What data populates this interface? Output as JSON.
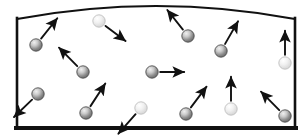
{
  "figure": {
    "title": "",
    "caption": "",
    "background_color": "#ffffff"
  },
  "container": {
    "name": "gas-container",
    "stroke_color": "#111111",
    "fill_color": "#ffffff",
    "wall_thickness_side": 2.6,
    "wall_thickness_bottom": 4.0,
    "wall_thickness_top": 2.2,
    "left_x": 17,
    "right_x": 295,
    "bottom_y": 128,
    "top_left_y": 19,
    "top_right_y": 19,
    "top_apex_x": 156,
    "top_apex_y": 4,
    "inner_shadow_color": "#f2f2f2"
  },
  "particles": {
    "dark_fill_center": "#e8e8e8",
    "dark_fill_edge": "#6d6d6d",
    "dark_stroke": "#4a4a4a",
    "light_fill_center": "#ffffff",
    "light_fill_edge": "#d2d2d2",
    "light_stroke": "#bdbdbd",
    "radius": 6.2,
    "items": [
      {
        "id": "particle-1",
        "shade": "dark",
        "cx": 36,
        "cy": 45,
        "vx": 0.62,
        "vy": -0.78,
        "speed": 26
      },
      {
        "id": "particle-2",
        "shade": "light",
        "cx": 99,
        "cy": 21,
        "vx": 0.8,
        "vy": 0.6,
        "speed": 25
      },
      {
        "id": "particle-3",
        "shade": "dark",
        "cx": 83,
        "cy": 72,
        "vx": -0.7,
        "vy": -0.71,
        "speed": 26
      },
      {
        "id": "particle-4",
        "shade": "dark",
        "cx": 188,
        "cy": 36,
        "vx": -0.62,
        "vy": -0.78,
        "speed": 25
      },
      {
        "id": "particle-5",
        "shade": "dark",
        "cx": 221,
        "cy": 51,
        "vx": 0.5,
        "vy": -0.87,
        "speed": 26
      },
      {
        "id": "particle-6",
        "shade": "dark",
        "cx": 152,
        "cy": 72,
        "vx": 1.0,
        "vy": 0.0,
        "speed": 24
      },
      {
        "id": "particle-7",
        "shade": "light",
        "cx": 285,
        "cy": 63,
        "vx": 0.0,
        "vy": -1.0,
        "speed": 24
      },
      {
        "id": "particle-8",
        "shade": "dark",
        "cx": 38,
        "cy": 94,
        "vx": -0.72,
        "vy": 0.69,
        "speed": 25
      },
      {
        "id": "particle-9",
        "shade": "dark",
        "cx": 86,
        "cy": 113,
        "vx": 0.55,
        "vy": -0.84,
        "speed": 27
      },
      {
        "id": "particle-10",
        "shade": "light",
        "cx": 141,
        "cy": 108,
        "vx": -0.66,
        "vy": 0.75,
        "speed": 26
      },
      {
        "id": "particle-11",
        "shade": "dark",
        "cx": 186,
        "cy": 114,
        "vx": 0.6,
        "vy": -0.8,
        "speed": 26
      },
      {
        "id": "particle-12",
        "shade": "light",
        "cx": 231,
        "cy": 109,
        "vx": 0.0,
        "vy": -1.0,
        "speed": 24
      },
      {
        "id": "particle-13",
        "shade": "dark",
        "cx": 285,
        "cy": 116,
        "vx": -0.7,
        "vy": -0.71,
        "speed": 26
      }
    ]
  },
  "arrows": {
    "color": "#111111",
    "line_width": 1.9,
    "head_length": 7.5,
    "head_width": 6.0,
    "gap_from_particle": 2.0
  },
  "labels": []
}
